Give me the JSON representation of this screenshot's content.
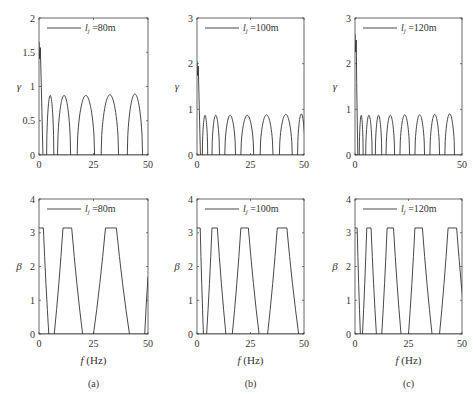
{
  "figure": {
    "captions": [
      "(a)",
      "(b)",
      "(c)"
    ],
    "xlabel": "f (Hz)",
    "line_color": "#333333"
  },
  "chart_data": [
    {
      "panel": "a-top",
      "type": "line",
      "title": "",
      "legend": "l_j =80m",
      "legend_main": "l",
      "legend_sub": "j",
      "legend_rest": " =80m",
      "xlabel": "",
      "ylabel": "γ",
      "xlim": [
        0,
        50
      ],
      "ylim": [
        0,
        2
      ],
      "xticks": [
        0,
        25,
        50
      ],
      "yticks": [
        0,
        0.5,
        1,
        1.5,
        2
      ],
      "ytick_labels": [
        "0",
        "0.5",
        "1",
        "1.5",
        "2"
      ],
      "grid": false,
      "legend_position": "upper left",
      "start_peak": {
        "x0": 0,
        "y0": 1.65,
        "x1": 1.8
      },
      "arches": [
        [
          3.5,
          6.8,
          0.87
        ],
        [
          8.5,
          14.5,
          0.87
        ],
        [
          17.5,
          25.5,
          0.87
        ],
        [
          28.5,
          36.5,
          0.88
        ],
        [
          40.5,
          47.5,
          0.89
        ]
      ]
    },
    {
      "panel": "a-bottom",
      "type": "line",
      "title": "",
      "legend": "l_j =80m",
      "legend_main": "l",
      "legend_sub": "j",
      "legend_rest": " =80m",
      "xlabel": "f (Hz)",
      "ylabel": "β",
      "xlim": [
        0,
        50
      ],
      "ylim": [
        0,
        4
      ],
      "xticks": [
        0,
        25,
        50
      ],
      "yticks": [
        0,
        1,
        2,
        3,
        4
      ],
      "ytick_labels": [
        "0",
        "1",
        "2",
        "3",
        "4"
      ],
      "grid": false,
      "legend_position": "upper left",
      "trapezoids": [
        [
          -2,
          -1,
          2,
          4.5
        ],
        [
          7,
          11,
          15,
          20
        ],
        [
          25,
          30.5,
          35.5,
          41.5
        ]
      ],
      "tail_rise": {
        "x0": 48.5,
        "x1": 50,
        "y1": 1.7
      }
    },
    {
      "panel": "b-top",
      "type": "line",
      "title": "",
      "legend": "l_j =100m",
      "legend_main": "l",
      "legend_sub": "j",
      "legend_rest": " =100m",
      "xlabel": "",
      "ylabel": "γ",
      "xlim": [
        0,
        50
      ],
      "ylim": [
        0,
        3
      ],
      "xticks": [
        0,
        25,
        50
      ],
      "yticks": [
        0,
        1,
        2,
        3
      ],
      "ytick_labels": [
        "0",
        "1",
        "2",
        "3"
      ],
      "grid": false,
      "legend_position": "upper left",
      "start_peak": {
        "x0": 0,
        "y0": 2.05,
        "x1": 1.6
      },
      "arches": [
        [
          2.5,
          5,
          0.87
        ],
        [
          7,
          10.5,
          0.87
        ],
        [
          13,
          18,
          0.87
        ],
        [
          20.5,
          26.5,
          0.87
        ],
        [
          29.5,
          35.5,
          0.88
        ],
        [
          38.5,
          44.5,
          0.89
        ],
        [
          47,
          50.5,
          0.9
        ]
      ]
    },
    {
      "panel": "b-bottom",
      "type": "line",
      "title": "",
      "legend": "l_j =100m",
      "legend_main": "l",
      "legend_sub": "j",
      "legend_rest": " =100m",
      "xlabel": "f (Hz)",
      "ylabel": "β",
      "xlim": [
        0,
        50
      ],
      "ylim": [
        0,
        4
      ],
      "xticks": [
        0,
        25,
        50
      ],
      "yticks": [
        0,
        1,
        2,
        3,
        4
      ],
      "ytick_labels": [
        "0",
        "1",
        "2",
        "3",
        "4"
      ],
      "grid": false,
      "legend_position": "upper left",
      "trapezoids": [
        [
          -2,
          -1,
          1.5,
          3
        ],
        [
          4.5,
          7,
          9.5,
          13.5
        ],
        [
          16.5,
          20.5,
          24,
          29
        ],
        [
          33,
          37.5,
          42,
          47.5
        ]
      ],
      "tail_rise": null
    },
    {
      "panel": "c-top",
      "type": "line",
      "title": "",
      "legend": "l_j =120m",
      "legend_main": "l",
      "legend_sub": "j",
      "legend_rest": " =120m",
      "xlabel": "",
      "ylabel": "γ",
      "xlim": [
        0,
        50
      ],
      "ylim": [
        0,
        3
      ],
      "xticks": [
        0,
        50
      ],
      "yticks": [
        0,
        1,
        2,
        3
      ],
      "ytick_labels": [
        "0",
        "1",
        "2",
        "3"
      ],
      "grid": false,
      "legend_position": "upper left",
      "start_peak": {
        "x0": 0,
        "y0": 2.65,
        "x1": 1.3
      },
      "arches": [
        [
          2,
          3.8,
          0.87
        ],
        [
          5,
          8,
          0.87
        ],
        [
          9.5,
          12.5,
          0.87
        ],
        [
          14.5,
          18.5,
          0.87
        ],
        [
          21,
          25.5,
          0.88
        ],
        [
          28,
          32.5,
          0.88
        ],
        [
          35,
          39.5,
          0.89
        ],
        [
          42,
          46.5,
          0.9
        ]
      ]
    },
    {
      "panel": "c-bottom",
      "type": "line",
      "title": "",
      "legend": "l_j =120m",
      "legend_main": "l",
      "legend_sub": "j",
      "legend_rest": " =120m",
      "xlabel": "f (Hz)",
      "ylabel": "β",
      "xlim": [
        0,
        50
      ],
      "ylim": [
        0,
        4
      ],
      "xticks": [
        0,
        25,
        50
      ],
      "yticks": [
        0,
        1,
        2,
        3,
        4
      ],
      "ytick_labels": [
        "0",
        "1",
        "2",
        "3",
        "4"
      ],
      "grid": false,
      "legend_position": "upper left",
      "trapezoids": [
        [
          -2,
          -1,
          1,
          2.5
        ],
        [
          3.5,
          5.5,
          7.5,
          10
        ],
        [
          12.5,
          15,
          18,
          21.5
        ],
        [
          25,
          28,
          31.5,
          36
        ],
        [
          39.5,
          43.5,
          47.5,
          52
        ]
      ],
      "tail_rise": null
    }
  ]
}
